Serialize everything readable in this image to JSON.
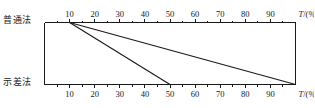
{
  "figure": {
    "width": 314,
    "height": 108,
    "background": "#ffffff",
    "ink_color": "#1a1a1a"
  },
  "labels": {
    "top_method": "普通法",
    "bottom_method": "示差法"
  },
  "chart_data": {
    "type": "line",
    "title": "",
    "subtitle": "",
    "xlabel": "T/(%)",
    "ylabel": "",
    "grid": false,
    "legend": null,
    "axes": [
      {
        "id": "top-axis",
        "name": "普通法",
        "position": "top",
        "label": "T/(%)",
        "label_symbol": "T",
        "label_unit": "(%)",
        "range": [
          0,
          100
        ],
        "major_step": 10,
        "minor_step": 5,
        "tick_labels": [
          "10",
          "20",
          "30",
          "40",
          "50",
          "60",
          "70",
          "80",
          "90"
        ],
        "tick_values": [
          10,
          20,
          30,
          40,
          50,
          60,
          70,
          80,
          90
        ],
        "tick_direction": "outward-up"
      },
      {
        "id": "bottom-axis",
        "name": "示差法",
        "position": "bottom",
        "label": "T/(%)",
        "label_symbol": "T",
        "label_unit": "(%)",
        "range": [
          0,
          100
        ],
        "major_step": 10,
        "minor_step": 5,
        "tick_labels": [
          "10",
          "20",
          "30",
          "40",
          "50",
          "60",
          "70",
          "80",
          "90"
        ],
        "tick_values": [
          10,
          20,
          30,
          40,
          50,
          60,
          70,
          80,
          90
        ],
        "tick_direction": "outward-down"
      }
    ],
    "series": [
      {
        "name": "mapping-line-1",
        "description": "steep mapping line",
        "from_axis": "top-axis",
        "to_axis": "bottom-axis",
        "x_top": 10,
        "x_bottom": 50
      },
      {
        "name": "mapping-line-2",
        "description": "shallow mapping line",
        "from_axis": "top-axis",
        "to_axis": "bottom-axis",
        "x_top": 10,
        "x_bottom": 100
      }
    ],
    "annotations": []
  }
}
